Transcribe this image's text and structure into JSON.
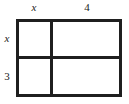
{
  "diagram": {
    "type": "area-model",
    "line_color": "#1f1f1f",
    "text_color": "#222222",
    "background_color": "#ffffff",
    "column_labels": [
      {
        "text": "x",
        "style": "italic"
      },
      {
        "text": "4",
        "style": "upright"
      }
    ],
    "row_labels": [
      {
        "text": "x",
        "style": "italic"
      },
      {
        "text": "3",
        "style": "upright"
      }
    ],
    "cells": [
      {
        "row": 0,
        "column": 0,
        "text": ""
      },
      {
        "row": 0,
        "column": 1,
        "text": ""
      },
      {
        "row": 1,
        "column": 0,
        "text": ""
      },
      {
        "row": 1,
        "column": 1,
        "text": ""
      }
    ]
  },
  "chart_data": {
    "type": "table",
    "title": "",
    "columns": [
      "x",
      "4"
    ],
    "rows": [
      "x",
      "3"
    ],
    "values": [
      [
        "",
        ""
      ],
      [
        "",
        ""
      ]
    ]
  }
}
